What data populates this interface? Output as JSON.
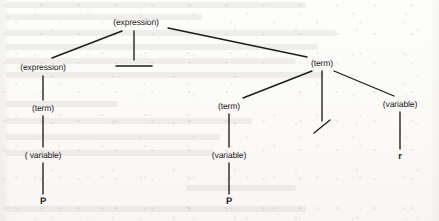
{
  "figure": {
    "kind": "parse-tree",
    "caption": "",
    "background_color": "#fcfcfa",
    "ink_color": "#1c1c1c"
  },
  "nodes": [
    {
      "id": "n0",
      "label": "(expression)",
      "kind": "nonterminal",
      "x": 136,
      "y": 22
    },
    {
      "id": "n1",
      "label": "(expression)",
      "kind": "nonterminal",
      "x": 43,
      "y": 67
    },
    {
      "id": "n2",
      "label": "—",
      "kind": "terminal",
      "x": 133,
      "y": 66
    },
    {
      "id": "n3",
      "label": "(term)",
      "kind": "nonterminal",
      "x": 322,
      "y": 63
    },
    {
      "id": "n4",
      "label": "(term)",
      "kind": "nonterminal",
      "x": 43,
      "y": 108
    },
    {
      "id": "n5",
      "label": "(term)",
      "kind": "nonterminal",
      "x": 229,
      "y": 106
    },
    {
      "id": "n6",
      "label": "/",
      "kind": "terminal",
      "x": 322,
      "y": 127
    },
    {
      "id": "n7",
      "label": "(variable)",
      "kind": "nonterminal",
      "x": 400,
      "y": 104
    },
    {
      "id": "n8",
      "label": "( variable)",
      "kind": "nonterminal",
      "x": 43,
      "y": 155
    },
    {
      "id": "n9",
      "label": "(variable)",
      "kind": "nonterminal",
      "x": 229,
      "y": 155
    },
    {
      "id": "n10",
      "label": "r",
      "kind": "terminal",
      "x": 400,
      "y": 156
    },
    {
      "id": "n11",
      "label": "P",
      "kind": "terminal",
      "x": 43,
      "y": 201
    },
    {
      "id": "n12",
      "label": "P",
      "kind": "terminal",
      "x": 229,
      "y": 201
    }
  ],
  "edges": [
    {
      "from": "n0",
      "to": "n1",
      "x1": 122,
      "y1": 31,
      "x2": 52,
      "y2": 58
    },
    {
      "from": "n0",
      "to": "n2",
      "x1": 134,
      "y1": 31,
      "x2": 134,
      "y2": 60
    },
    {
      "from": "n0",
      "to": "n3",
      "x1": 168,
      "y1": 28,
      "x2": 307,
      "y2": 57
    },
    {
      "from": "n1",
      "to": "n4",
      "x1": 43,
      "y1": 76,
      "x2": 43,
      "y2": 100
    },
    {
      "from": "n3",
      "to": "n5",
      "x1": 312,
      "y1": 71,
      "x2": 243,
      "y2": 98
    },
    {
      "from": "n3",
      "to": "n6",
      "x1": 322,
      "y1": 71,
      "x2": 322,
      "y2": 121
    },
    {
      "from": "n3",
      "to": "n7",
      "x1": 334,
      "y1": 71,
      "x2": 394,
      "y2": 96
    },
    {
      "from": "n4",
      "to": "n8",
      "x1": 43,
      "y1": 116,
      "x2": 43,
      "y2": 147
    },
    {
      "from": "n5",
      "to": "n9",
      "x1": 229,
      "y1": 114,
      "x2": 229,
      "y2": 147
    },
    {
      "from": "n7",
      "to": "n10",
      "x1": 400,
      "y1": 112,
      "x2": 400,
      "y2": 149
    },
    {
      "from": "n8",
      "to": "n11",
      "x1": 43,
      "y1": 163,
      "x2": 43,
      "y2": 194
    },
    {
      "from": "n9",
      "to": "n12",
      "x1": 229,
      "y1": 163,
      "x2": 229,
      "y2": 194
    }
  ],
  "terminal_marks": {
    "minus_dash": {
      "x1": 116,
      "y1": 66,
      "x2": 152,
      "y2": 66
    },
    "slash": {
      "x1": 314,
      "y1": 133,
      "x2": 330,
      "y2": 120
    }
  },
  "ghost_text_lines": [
    {
      "x": 6,
      "y": 2,
      "w": 300
    },
    {
      "x": 6,
      "y": 14,
      "w": 196
    },
    {
      "x": 6,
      "y": 30,
      "w": 330
    },
    {
      "x": 6,
      "y": 44,
      "w": 312
    },
    {
      "x": 6,
      "y": 58,
      "w": 290
    },
    {
      "x": 6,
      "y": 72,
      "w": 318
    },
    {
      "x": 6,
      "y": 101,
      "w": 112
    },
    {
      "x": 6,
      "y": 118,
      "w": 246
    },
    {
      "x": 6,
      "y": 134,
      "w": 214
    },
    {
      "x": 6,
      "y": 150,
      "w": 208
    },
    {
      "x": 186,
      "y": 185,
      "w": 110
    },
    {
      "x": 6,
      "y": 206,
      "w": 300
    }
  ]
}
